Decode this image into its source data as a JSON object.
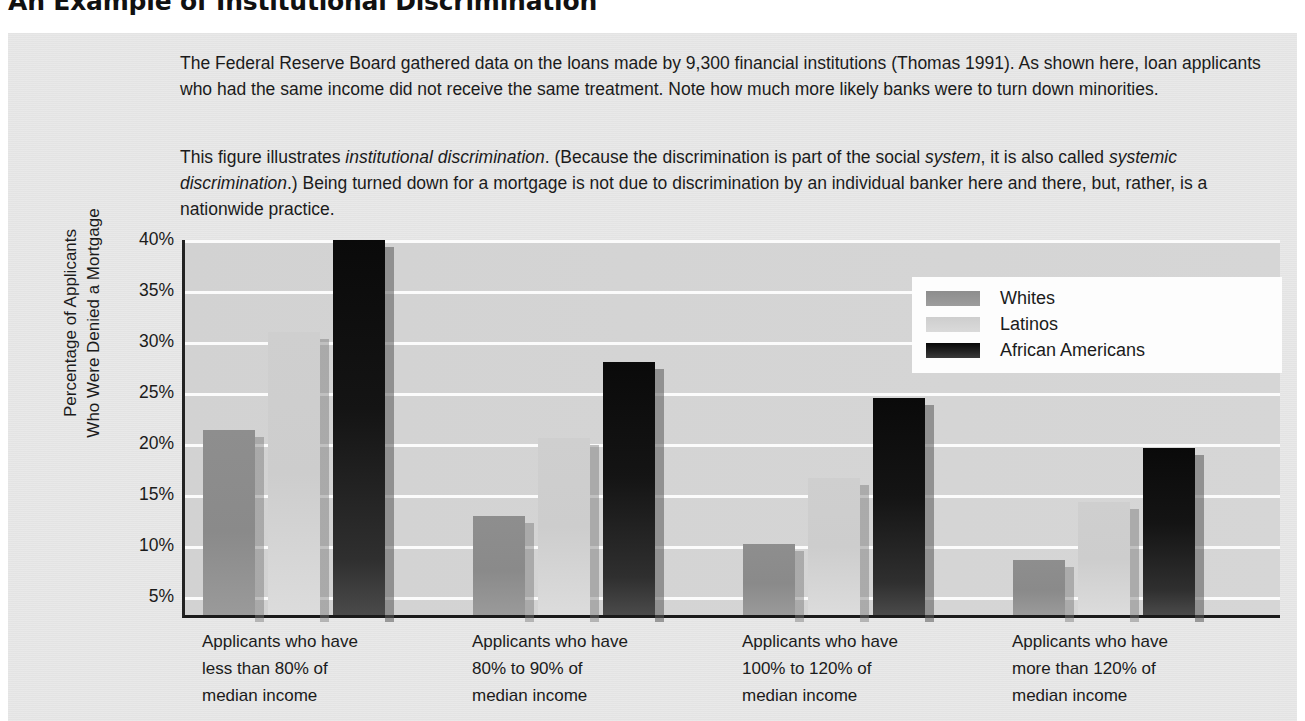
{
  "title": "An Example of Institutional Discrimination",
  "paragraphs": [
    "The Federal Reserve Board gathered data on the loans made by 9,300 financial institutions (Thomas 1991). As shown here, loan applicants who had the same income did not receive the same treatment. Note how much more likely banks were to turn down minorities.",
    "This figure illustrates institutional discrimination. (Because the discrimination is part of the social system, it is also called systemic discrimination.) Being turned down for a mortgage is not due to discrimination by an individual banker here and there, but, rather, is a nationwide practice."
  ],
  "paragraph2_parts": {
    "a": "This figure illustrates ",
    "b": "institutional discrimination",
    "c": ". (Because the discrimination is part of the social ",
    "d": "system",
    "e": ", it is also called ",
    "f": "systemic discrimination",
    "g": ".) Being turned down for a mortgage is not due to discrimination by an individual banker here and there, but, rather, is a nationwide practice."
  },
  "axis": {
    "ylabel_line1": "Percentage of Applicants",
    "ylabel_line2": "Who Were Denied a Mortgage",
    "yticks": [
      "40%",
      "35%",
      "30%",
      "25%",
      "20%",
      "15%",
      "10%",
      "5%"
    ]
  },
  "legend": {
    "items": [
      {
        "label": "Whites",
        "color": "#8d8d8d",
        "key": "whites"
      },
      {
        "label": "Latinos",
        "color": "#cecece",
        "key": "latinos"
      },
      {
        "label": "African Americans",
        "color": "#0a0a0a",
        "key": "african"
      }
    ]
  },
  "categories_multiline": [
    [
      "Applicants who have",
      "less than 80% of",
      "median income"
    ],
    [
      "Applicants who have",
      "80% to 90% of",
      "median income"
    ],
    [
      "Applicants who have",
      "100% to 120% of",
      "median income"
    ],
    [
      "Applicants who have",
      "more than 120% of",
      "median income"
    ]
  ],
  "chart_data": {
    "type": "bar",
    "title": "An Example of Institutional Discrimination",
    "xlabel": "",
    "ylabel": "Percentage of Applicants Who Were Denied a Mortgage",
    "ylim": [
      5,
      40
    ],
    "ytick_values": [
      40,
      35,
      30,
      25,
      20,
      15,
      10,
      5
    ],
    "grid": true,
    "legend_position": "upper-right-inside",
    "categories": [
      "Applicants who have less than 80% of median income",
      "Applicants who have 80% to 90% of median income",
      "Applicants who have 100% to 120% of median income",
      "Applicants who have more than 120% of median income"
    ],
    "series": [
      {
        "name": "Whites",
        "color": "#8d8d8d",
        "values": [
          21.4,
          12.9,
          10.2,
          8.6
        ]
      },
      {
        "name": "Latinos",
        "color": "#cecece",
        "values": [
          31.0,
          20.6,
          16.7,
          14.3
        ]
      },
      {
        "name": "African Americans",
        "color": "#0a0a0a",
        "values": [
          40.0,
          28.0,
          24.5,
          19.6
        ]
      }
    ],
    "units": "percent"
  }
}
